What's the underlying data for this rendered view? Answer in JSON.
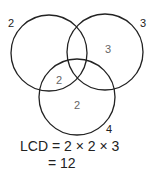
{
  "diagram": {
    "type": "venn",
    "circles": [
      {
        "name": "left",
        "label": "2",
        "cx": 49,
        "cy": 53,
        "r": 38
      },
      {
        "name": "right",
        "label": "3",
        "cx": 105,
        "cy": 52,
        "r": 38
      },
      {
        "name": "bottom",
        "label": "4",
        "cx": 77,
        "cy": 97,
        "r": 38
      }
    ],
    "regions": {
      "right_only": "3",
      "left_bottom_overlap": "2",
      "bottom_only": "2"
    },
    "equation_line1": "LCD = 2 × 2 × 3",
    "equation_line2": "= 12"
  }
}
